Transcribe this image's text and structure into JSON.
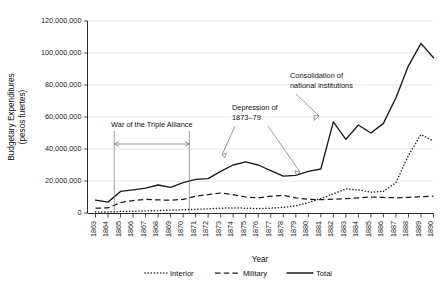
{
  "chart_data": {
    "type": "line",
    "title": "",
    "xlabel": "Year",
    "ylabel": "Budgetary Expenditures (pesos fuertes)",
    "ylabel_line1": "Budgetary Expenditures",
    "ylabel_line2": "(pesos fuertes)",
    "ylim": [
      0,
      120000000
    ],
    "ytick_values": [
      0,
      20000000,
      40000000,
      60000000,
      80000000,
      100000000,
      120000000
    ],
    "ytick_labels": [
      "0",
      "20,000,000",
      "40,000,000",
      "60,000,000",
      "80,000,000",
      "100,000,000",
      "120,000,000"
    ],
    "grid": true,
    "grid_axis": "y",
    "legend_position": "bottom",
    "xlim": [
      1863,
      1890
    ],
    "categories": [
      1863,
      1864,
      1865,
      1866,
      1867,
      1868,
      1869,
      1870,
      1871,
      1872,
      1873,
      1874,
      1875,
      1876,
      1877,
      1878,
      1879,
      1880,
      1881,
      1882,
      1883,
      1884,
      1885,
      1886,
      1887,
      1888,
      1889,
      1890
    ],
    "xtick_labels": [
      "1863",
      "1864",
      "1865",
      "1866",
      "1867",
      "1868",
      "1869",
      "1870",
      "1871",
      "1872",
      "1873",
      "1874",
      "1875",
      "1876",
      "1877",
      "1878",
      "1879",
      "1880",
      "1881",
      "1882",
      "1883",
      "1884",
      "1885",
      "1886",
      "1887",
      "1888",
      "1889",
      "1890"
    ],
    "series": [
      {
        "name": "Interior",
        "style": "dotted",
        "values": [
          600000,
          700000,
          900000,
          1100000,
          1300000,
          1500000,
          1800000,
          2000000,
          2300000,
          2600000,
          3000000,
          3200000,
          3000000,
          2800000,
          3000000,
          3500000,
          4500000,
          6500000,
          9000000,
          12000000,
          15000000,
          14500000,
          13000000,
          13500000,
          19000000,
          36000000,
          49000000,
          45000000
        ]
      },
      {
        "name": "Military",
        "style": "dashed",
        "values": [
          3000000,
          3200000,
          6500000,
          7800000,
          8500000,
          8200000,
          8000000,
          8500000,
          10500000,
          11500000,
          12500000,
          11500000,
          10000000,
          9500000,
          10500000,
          11000000,
          9500000,
          8500000,
          8300000,
          8600000,
          9000000,
          9500000,
          10000000,
          9700000,
          9500000,
          9800000,
          10200000,
          10500000
        ]
      },
      {
        "name": "Total",
        "style": "solid",
        "values": [
          8000000,
          6800000,
          13500000,
          14500000,
          15500000,
          17500000,
          16000000,
          19000000,
          21000000,
          21500000,
          26000000,
          30000000,
          32000000,
          30000000,
          26500000,
          23000000,
          23500000,
          26000000,
          27500000,
          57000000,
          46000000,
          55000000,
          50000000,
          56000000,
          72000000,
          92000000,
          106000000,
          97000000
        ]
      }
    ],
    "annotations": [
      {
        "id": "war-triple-alliance",
        "text": "War of the Triple Alliance",
        "start_year": 1864.5,
        "end_year": 1870.5,
        "kind": "span-bracket"
      },
      {
        "id": "depression",
        "line1": "Depression of",
        "line2": "1873–79",
        "text": "Depression of 1873–79",
        "kind": "label-two-arrows"
      },
      {
        "id": "consolidation",
        "line1": "Consolidation of",
        "line2": "national institutions",
        "text": "Consolidation of national institutions",
        "kind": "label-arrow"
      }
    ],
    "legend": [
      {
        "label": "Interior",
        "style": "dotted"
      },
      {
        "label": "Military",
        "style": "dashed"
      },
      {
        "label": "Total",
        "style": "solid"
      }
    ],
    "colors": {
      "series": "#1a1a1a",
      "grid": "#d9d9d9",
      "axis": "#2b2b2b",
      "annotation": "#6f6f6f",
      "background": "#ffffff"
    }
  }
}
